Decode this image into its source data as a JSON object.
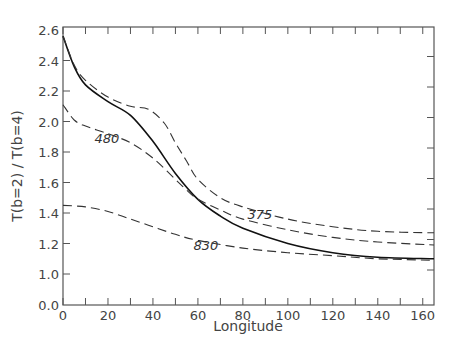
{
  "chart_data": {
    "type": "line",
    "title": "",
    "xlabel": "Longitude",
    "ylabel": "T(b=2) / T(b=4)",
    "xlim": [
      0,
      165
    ],
    "ylim_display": [
      0.0,
      2.6
    ],
    "y_axis_break": "axis jumps from 0.0 directly to 1.0",
    "x_ticks": [
      0,
      20,
      40,
      60,
      80,
      100,
      120,
      140,
      160
    ],
    "x_minor_ticks_every": 10,
    "y_ticks": [
      "0.0",
      "1.0",
      "1.2",
      "1.4",
      "1.6",
      "1.8",
      "2.0",
      "2.2",
      "2.4",
      "2.6"
    ],
    "grid": false,
    "legend": "none (inline curve labels)",
    "series": [
      {
        "name": "solid",
        "style": "solid",
        "label": "",
        "x": [
          0,
          5,
          10,
          20,
          30,
          40,
          50,
          60,
          70,
          80,
          100,
          120,
          140,
          165
        ],
        "values": [
          2.56,
          2.36,
          2.24,
          2.13,
          2.04,
          1.87,
          1.66,
          1.49,
          1.38,
          1.3,
          1.2,
          1.14,
          1.11,
          1.1
        ]
      },
      {
        "name": "375",
        "style": "dashed",
        "label": "375",
        "label_pos": [
          82,
          1.36
        ],
        "x": [
          0,
          5,
          10,
          20,
          30,
          38,
          45,
          50,
          55,
          60,
          70,
          80,
          100,
          120,
          140,
          165
        ],
        "values": [
          2.56,
          2.37,
          2.27,
          2.16,
          2.1,
          2.08,
          1.99,
          1.86,
          1.74,
          1.62,
          1.5,
          1.44,
          1.36,
          1.31,
          1.28,
          1.27
        ]
      },
      {
        "name": "480",
        "style": "dashed",
        "label": "480",
        "label_pos": [
          14,
          1.86
        ],
        "x": [
          0,
          5,
          10,
          20,
          30,
          40,
          50,
          55,
          60,
          70,
          80,
          100,
          120,
          140,
          165
        ],
        "values": [
          2.11,
          2.01,
          1.97,
          1.92,
          1.86,
          1.76,
          1.62,
          1.55,
          1.49,
          1.42,
          1.36,
          1.29,
          1.24,
          1.21,
          1.19
        ]
      },
      {
        "name": "830",
        "style": "dashed",
        "label": "830",
        "label_pos": [
          58,
          1.16
        ],
        "x": [
          0,
          10,
          20,
          30,
          40,
          50,
          60,
          80,
          100,
          120,
          140,
          165
        ],
        "values": [
          1.45,
          1.44,
          1.41,
          1.36,
          1.31,
          1.26,
          1.22,
          1.17,
          1.14,
          1.12,
          1.1,
          1.09
        ]
      }
    ]
  },
  "axes": {
    "xlabel": "Longitude",
    "ylabel": "T(b=2) / T(b=4)"
  }
}
